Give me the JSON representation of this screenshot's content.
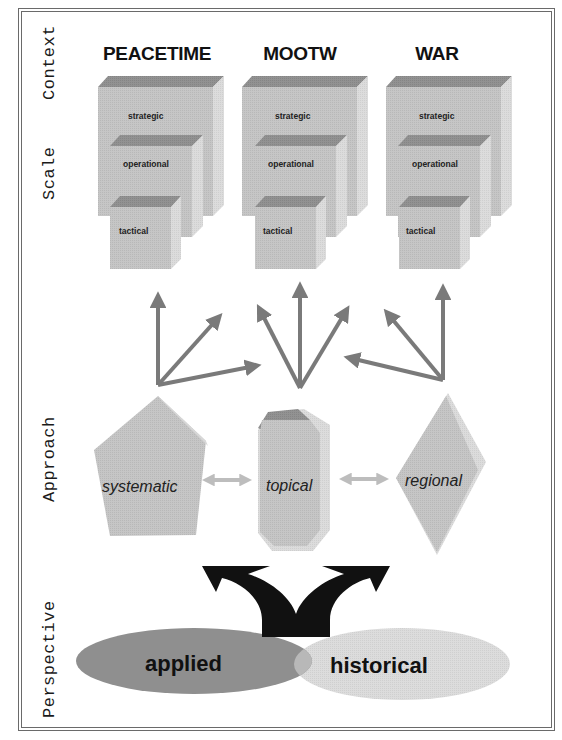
{
  "side_labels": {
    "context": "Context",
    "scale": "Scale",
    "approach": "Approach",
    "perspective": "Perspective"
  },
  "columns": [
    {
      "title": "PEACETIME",
      "cubes": [
        "strategic",
        "operational",
        "tactical"
      ]
    },
    {
      "title": "MOOTW",
      "cubes": [
        "strategic",
        "operational",
        "tactical"
      ]
    },
    {
      "title": "WAR",
      "cubes": [
        "strategic",
        "operational",
        "tactical"
      ]
    }
  ],
  "approach": {
    "shapes": [
      {
        "label": "systematic",
        "shape": "pentagon"
      },
      {
        "label": "topical",
        "shape": "octagonal-prism"
      },
      {
        "label": "regional",
        "shape": "diamond"
      }
    ]
  },
  "perspective": {
    "left": "applied",
    "right": "historical"
  },
  "colors": {
    "cube_front": "#c4c4c4",
    "cube_top": "#8e8e8e",
    "cube_side": "#dadada",
    "arrow_gray": "#7a7a7a",
    "double_arrow": "#bdbdbd",
    "applied_ellipse": "#8f8f8f",
    "historical_ellipse": "#dedede",
    "overlap": "#b4b4b4",
    "black_arrow": "#111111"
  }
}
